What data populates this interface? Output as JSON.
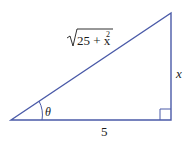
{
  "diagram": {
    "type": "right-triangle",
    "stroke_color": "#4a5aa8",
    "labels": {
      "hypotenuse_radicand": "25 + x",
      "hypotenuse_exponent": "2",
      "opposite": "x",
      "adjacent": "5",
      "angle": "θ"
    }
  }
}
